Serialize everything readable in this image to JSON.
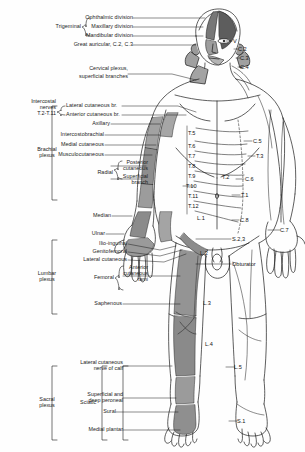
{
  "figure": {
    "ink_color": "#1a1a1a",
    "shade_color": "#9a9a9a",
    "shade_dark": "#6f6f6f",
    "background": "#ffffff"
  },
  "left_labels": {
    "trigeminal_group": "Trigeminal",
    "ophthalmic": "Ophthalmic division",
    "maxillary": "Maxillary division",
    "mandibular": "Mandibular division",
    "great_auricular": "Great auricular, C.2, C.3",
    "cervical_plexus": "Cervical plexus,",
    "cervical_plexus2": "superficial branches",
    "intercostal_nerves": "Intercostal\nnerves\nT.2-T.11",
    "lateral_cutaneous_br": "Lateral cutaneous br.",
    "anterior_cutaneous_br": "Anterior cutaneous br.",
    "axillary": "Axillary",
    "intercostobrachial": "Intercostobrachial",
    "medial_cutaneous": "Medial cutaneous",
    "musculocutaneous": "Musculocutaneous",
    "radial_group": "Radial",
    "posterior_cutaneous": "Posterior\ncutaneous",
    "superficial_branch": "Superficial\nbranch",
    "brachial_plexus": "Brachial\nplexus",
    "median": "Median",
    "ulnar": "Ulnar",
    "ilio_inguinal": "Ilio-inguinal",
    "genitofemoral": "Genitofemoral",
    "lateral_cutaneous": "Lateral cutaneous",
    "femoral_group": "Femoral",
    "anterior_cutaneous_rami": "Anterior\ncutaneous\nrami",
    "saphenous": "Saphenous",
    "lumbar_plexus": "Lumbar\nplexus",
    "sacral_plexus": "Sacral\nplexus",
    "sciatic_group": "Sciatic",
    "lateral_cutaneous_calf": "Lateral cutaneous\nnerve of calf",
    "superficial_deep_peroneal": "Superficial and\ndeep peroneal",
    "sural": "Sural",
    "medial_plantar": "Medial plantar"
  },
  "dermatomes": {
    "head": [
      "V",
      "C.2",
      "C.3",
      "C.4"
    ],
    "trunk": [
      "T.5",
      "T.6",
      "T.7",
      "T.8",
      "T.9",
      "T.10",
      "T.11",
      "T.12",
      "L.1",
      "L.2",
      "L.3",
      "L.4",
      "L.5",
      "S.1"
    ],
    "arm_right": [
      "C.5",
      "T.3",
      "T.2",
      "C.6",
      "T.1",
      "C.8",
      "C.7"
    ],
    "pelvis": [
      "S.2,3",
      "Obturator"
    ]
  },
  "dermatome_positions": {
    "V": {
      "x": 233,
      "y": 41
    },
    "C.2": {
      "x": 238,
      "y": 49
    },
    "C.3": {
      "x": 240,
      "y": 58
    },
    "C.4": {
      "x": 240,
      "y": 67
    },
    "C.5": {
      "x": 253,
      "y": 141
    },
    "T.5": {
      "x": 188,
      "y": 133
    },
    "T.6": {
      "x": 188,
      "y": 146
    },
    "T.3": {
      "x": 256,
      "y": 156
    },
    "T.7": {
      "x": 188,
      "y": 156
    },
    "T.8": {
      "x": 188,
      "y": 166
    },
    "T.9": {
      "x": 188,
      "y": 176
    },
    "T.2": {
      "x": 222,
      "y": 177
    },
    "C.6": {
      "x": 245,
      "y": 179
    },
    "T.10": {
      "x": 186,
      "y": 186
    },
    "T.11": {
      "x": 188,
      "y": 196
    },
    "T.1": {
      "x": 241,
      "y": 195
    },
    "T.12": {
      "x": 188,
      "y": 206
    },
    "L.1": {
      "x": 197,
      "y": 218
    },
    "C.8": {
      "x": 240,
      "y": 220
    },
    "C.7": {
      "x": 280,
      "y": 230
    },
    "S.2,3": {
      "x": 232,
      "y": 239
    },
    "L.2": {
      "x": 200,
      "y": 253
    },
    "Obturator": {
      "x": 232,
      "y": 264
    },
    "L.3": {
      "x": 203,
      "y": 303
    },
    "L.4": {
      "x": 205,
      "y": 344
    },
    "L.5": {
      "x": 234,
      "y": 367
    },
    "S.1": {
      "x": 237,
      "y": 421
    }
  }
}
